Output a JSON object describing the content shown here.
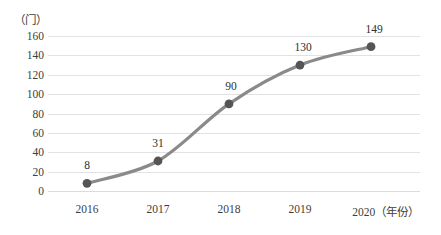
{
  "chart_data": {
    "type": "line",
    "title": "",
    "subtitle": "",
    "xlabel": "年份",
    "ylabel": "门",
    "y_unit_label": "（门）",
    "x_axis_suffix": "（年份）",
    "categories": [
      "2016",
      "2017",
      "2018",
      "2019",
      "2020"
    ],
    "values": [
      8,
      31,
      90,
      130,
      149
    ],
    "series": [
      {
        "name": "",
        "values": [
          8,
          31,
          90,
          130,
          149
        ]
      }
    ],
    "point_labels": [
      "8",
      "31",
      "90",
      "130",
      "149"
    ],
    "ylim": [
      0,
      160
    ],
    "y_ticks": [
      0,
      20,
      40,
      60,
      80,
      100,
      120,
      140,
      160
    ],
    "y_tick_labels": [
      "0",
      "20",
      "40",
      "60",
      "80",
      "100",
      "120",
      "140",
      "160"
    ],
    "x_tick_labels": [
      "2016",
      "2017",
      "2018",
      "2019",
      "2020（年份）"
    ],
    "grid": true,
    "grid_axis": "y",
    "legend": false,
    "legend_position": "none",
    "line_color": "#8a8a8a",
    "marker_color": "#555555",
    "grid_color": "#e2e2e4",
    "text_color": "#3d3d3d",
    "background_color": "#ffffff",
    "smooth": true
  }
}
